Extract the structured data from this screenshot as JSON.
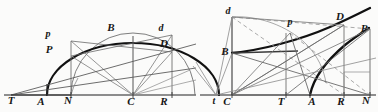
{
  "plate": {
    "title": "Conic section construction plate",
    "background_color": "#fbfbfa",
    "ink_color": "#161616",
    "faint_ink_color": "#7b7b7b",
    "width": 378,
    "height": 112
  },
  "figures": [
    {
      "id": "left-figure",
      "name": "ellipse-construction",
      "description": "Ellipse with auxiliary circle, centre C, tangent and normal at P and D",
      "baseline_label": "base-line",
      "labels": [
        {
          "key": "T",
          "text": "T",
          "case": "capital",
          "x": 11,
          "y": 104
        },
        {
          "key": "A",
          "text": "A",
          "case": "capital",
          "x": 41,
          "y": 105
        },
        {
          "key": "N",
          "text": "N",
          "case": "capital",
          "x": 68,
          "y": 104
        },
        {
          "key": "C",
          "text": "C",
          "case": "capital",
          "x": 131,
          "y": 105
        },
        {
          "key": "R",
          "text": "R",
          "case": "capital",
          "x": 164,
          "y": 105
        },
        {
          "key": "p",
          "text": "p",
          "case": "lower",
          "x": 48,
          "y": 37
        },
        {
          "key": "P",
          "text": "P",
          "case": "capital",
          "x": 49,
          "y": 53
        },
        {
          "key": "B",
          "text": "B",
          "case": "capital",
          "x": 111,
          "y": 31
        },
        {
          "key": "d",
          "text": "d",
          "case": "lower",
          "x": 161,
          "y": 31
        },
        {
          "key": "D",
          "text": "D",
          "case": "capital",
          "x": 164,
          "y": 47
        }
      ]
    },
    {
      "id": "right-figure",
      "name": "hyperbola-construction",
      "description": "Hyperbola with centre C, conjugate axis, tangent and normal at P and D",
      "baseline_label": "base-line",
      "labels": [
        {
          "key": "t",
          "text": "t",
          "case": "lower",
          "x": 214,
          "y": 104
        },
        {
          "key": "C",
          "text": "C",
          "case": "capital",
          "x": 227,
          "y": 105
        },
        {
          "key": "T",
          "text": "T",
          "case": "capital",
          "x": 281,
          "y": 105
        },
        {
          "key": "A",
          "text": "A",
          "case": "capital",
          "x": 312,
          "y": 105
        },
        {
          "key": "R",
          "text": "R",
          "case": "capital",
          "x": 341,
          "y": 105
        },
        {
          "key": "N",
          "text": "N",
          "case": "capital",
          "x": 366,
          "y": 104
        },
        {
          "key": "d",
          "text": "d",
          "case": "lower",
          "x": 228,
          "y": 14
        },
        {
          "key": "B",
          "text": "B",
          "case": "capital",
          "x": 227,
          "y": 51
        },
        {
          "key": "p",
          "text": "p",
          "case": "lower",
          "x": 290,
          "y": 25
        },
        {
          "key": "D",
          "text": "D",
          "case": "capital",
          "x": 340,
          "y": 20
        },
        {
          "key": "P",
          "text": "P",
          "case": "capital",
          "x": 363,
          "y": 32
        }
      ]
    }
  ]
}
